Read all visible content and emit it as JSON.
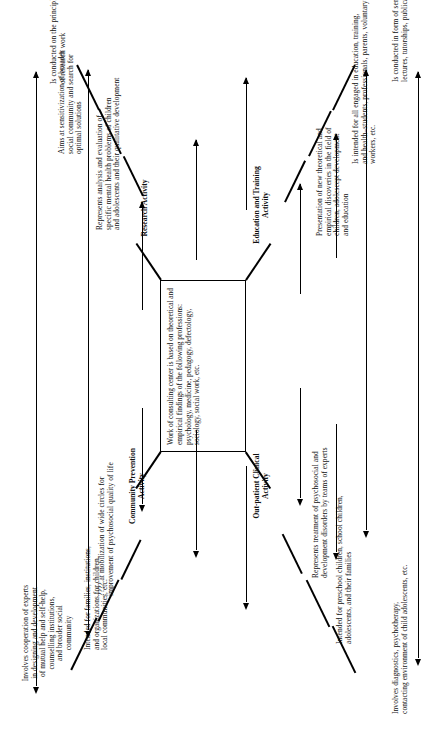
{
  "diagram": {
    "type": "organizational-flow",
    "orientation": "rotated-90-ccw",
    "center": {
      "text": "Work of consulting center is based on theoretical and empirical findings of the following professions: psychology, medicine, pedagogy, defectology, sociology, social work, etc."
    },
    "branches": [
      {
        "id": "out-patient-clinical",
        "title": "Out-patient Clinical\nActivity",
        "notes": [
          "Involves diagnostics, psychotherapy,\ncontacting environment of child adolescents, etc.",
          "Intended for preschool children, school children,\nadolescents, and their families",
          "Represents treatment of psychosocial and\ndevelopment disorders by teams of experts"
        ]
      },
      {
        "id": "community-prevention",
        "title": "Community  Prevention\nActivity",
        "notes": [
          "Involves cooperation of experts\nin designing and development\nof mutual help and self-help,\ncounselling institutions,\nand broader social\ncommunity",
          "Intended for families, institutions,\nand organizations for children,\nlocal communities, etc.",
          "???? at mobilization of wide circles for\nimprovement of psychosocial quality of life"
        ]
      },
      {
        "id": "research-activity",
        "title": "Research Activity",
        "notes": [
          "Represents analysis and evaluation of\nspecific mental health problems of children\nand adolescents and their qualitative development",
          "Aims at sensitivization of broader\nsocial community and search for\noptimal solutions",
          "Is conducted on the principles\nof research work"
        ]
      },
      {
        "id": "education-and-training",
        "title": "Education and Training\nActivity",
        "notes": [
          "Presentation of new theoretical and\nempirical discoveries in the field of\nchildren, adolescept development\nand education",
          "Is intended for all engaged in education, training,\nand health–students, professionals, parents, voluntary\nworkers, etc.",
          "Is conducted in form of seminars, group discussions,\nlectures, tutorships, publications, etc."
        ]
      }
    ],
    "colors": {
      "ink": "#101010",
      "rule": "#000000",
      "paper": "#ffffff"
    }
  }
}
